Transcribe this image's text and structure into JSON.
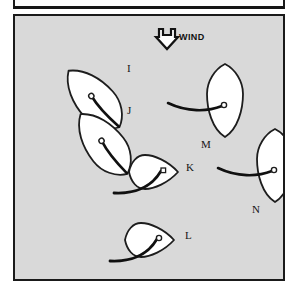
{
  "figure": {
    "type": "sailing-points-of-sail-diagram",
    "background_color": "#d9d9d9",
    "ink_color": "#1a1a1a",
    "hull_fill": "#ffffff"
  },
  "wind": {
    "label": "WIND",
    "direction": "down",
    "arrow_icon": "wind-arrow-down-icon"
  },
  "boats": [
    {
      "id": "I",
      "label": "I",
      "heading_deg": 300,
      "description": "close-hauled on port tack, bow up-left",
      "label_x": 112,
      "label_y": 47
    },
    {
      "id": "J",
      "label": "J",
      "heading_deg": 310,
      "description": "close-hauled on port tack, bow up-left",
      "label_x": 112,
      "label_y": 89
    },
    {
      "id": "K",
      "label": "K",
      "heading_deg": 90,
      "description": "beam reach, bow to the right",
      "label_x": 171,
      "label_y": 146
    },
    {
      "id": "L",
      "label": "L",
      "heading_deg": 90,
      "description": "beam reach, bow to the right",
      "label_x": 170,
      "label_y": 214
    },
    {
      "id": "M",
      "label": "M",
      "heading_deg": 180,
      "description": "running downwind, bow down",
      "label_x": 186,
      "label_y": 123
    },
    {
      "id": "N",
      "label": "N",
      "heading_deg": 180,
      "description": "running downwind, bow down",
      "label_x": 237,
      "label_y": 188
    }
  ]
}
